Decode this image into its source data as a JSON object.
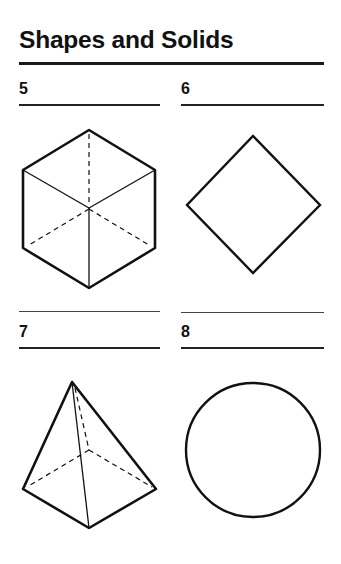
{
  "page": {
    "title": "Shapes and Solids"
  },
  "items": [
    {
      "number": "5",
      "shape": "cube",
      "description": "Cube drawn in isometric view with hidden edges dashed"
    },
    {
      "number": "6",
      "shape": "square",
      "description": "Square rotated 45 degrees (diamond)"
    },
    {
      "number": "7",
      "shape": "square-pyramid",
      "description": "Square pyramid with hidden edges dashed"
    },
    {
      "number": "8",
      "shape": "circle",
      "description": "Circle"
    }
  ],
  "colors": {
    "ink": "#111111",
    "background": "#ffffff"
  }
}
